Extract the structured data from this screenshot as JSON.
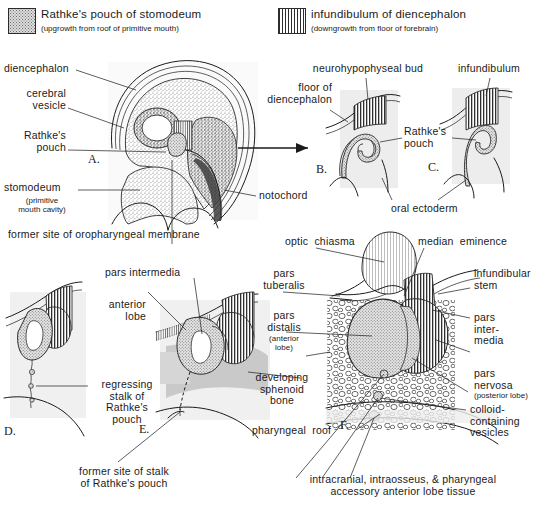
{
  "figure": {
    "legend": [
      {
        "id": "rathkes-pouch",
        "swatch": "stipple-pattern",
        "label": "Rathke's pouch of stomodeum",
        "sublabel": "(upgrowth from roof of primitive mouth)"
      },
      {
        "id": "infundibulum",
        "swatch": "vertical-stripe-pattern",
        "label": "infundibulum of diencephalon",
        "sublabel": "(downgrowth from floor of forebrain)"
      }
    ],
    "panels": [
      {
        "id": "A",
        "letter": "A."
      },
      {
        "id": "B",
        "letter": "B."
      },
      {
        "id": "C",
        "letter": "C."
      },
      {
        "id": "D",
        "letter": "D."
      },
      {
        "id": "E",
        "letter": "E."
      },
      {
        "id": "F",
        "letter": "F."
      }
    ],
    "labels": {
      "diencephalon": "diencephalon",
      "cerebral_vesicle": "cerebral\nvesicle",
      "rathkes_pouch_a": "Rathke's\npouch",
      "stomodeum": "stomodeum",
      "stomodeum_sub": "(primitive\nmouth cavity)",
      "former_site_oropharyngeal": "former site of oropharyngeal membrane",
      "notochord": "notochord",
      "floor_of_diencephalon": "floor of\ndiencephalon",
      "neurohypophyseal_bud": "neurohypophyseal bud",
      "infundibulum_c": "infundibulum",
      "rathkes_pouch_bc": "Rathke's\npouch",
      "oral_ectoderm": "oral ectoderm",
      "pars_intermedia_e": "pars intermedia",
      "anterior_lobe_e": "anterior\nlobe",
      "regressing_stalk": "regressing\nstalk of\nRathke's\npouch",
      "former_site_stalk": "former site of stalk\nof Rathke's pouch",
      "optic_chiasma": "optic  chiasma",
      "median_eminence": "median  eminence",
      "pars_tuberalis": "pars\ntuberalis",
      "pars_distalis": "pars\ndistalis",
      "pars_distalis_sub": "(anterior\nlobe)",
      "developing_sphenoid_bone": "developing\nsphenoid\nbone",
      "pharyngeal_roof": "pharyngeal  roof",
      "infundibular_stem": "infundibular\nstem",
      "pars_intermedia_f": "pars\ninter-\nmedia",
      "pars_nervosa": "pars\nnervosa",
      "pars_nervosa_sub": "(posterior lobe)",
      "colloid_vesicles": "colloid-\ncontaining\nvesicles",
      "accessory_tissue": "intracranial, intraosseus, & pharyngeal\naccessory anterior lobe tissue"
    },
    "colors": {
      "ink": "#1b1b1b",
      "leader": "#2a2a2a",
      "stipple_fill": "#dedede",
      "stripe_dark": "#2f2f2f",
      "tissue_gray": "#c9c9c9",
      "light_gray": "#eaeaea",
      "background": "#ffffff"
    }
  }
}
